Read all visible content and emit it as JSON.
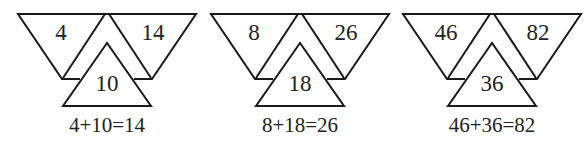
{
  "groups": [
    {
      "left": "4",
      "right": "14",
      "center": "10",
      "equation": "4+10=14"
    },
    {
      "left": "8",
      "right": "26",
      "center": "18",
      "equation": "8+18=26"
    },
    {
      "left": "46",
      "right": "82",
      "center": "36",
      "equation": "46+36=82"
    }
  ]
}
